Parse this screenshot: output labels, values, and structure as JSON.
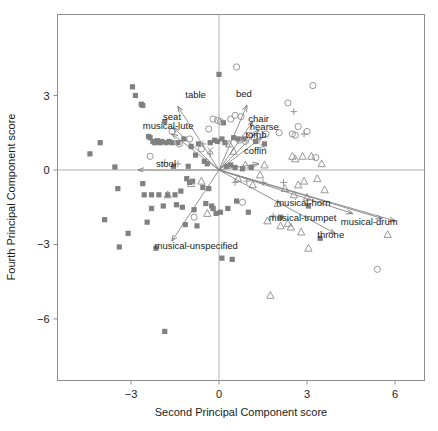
{
  "chart_data": {
    "type": "scatter",
    "title": "",
    "subtitle": "",
    "xlabel": "Second Principal Component score",
    "ylabel": "Fourth Principal Component score",
    "xlim": [
      -4.6,
      7.05
    ],
    "ylim": [
      -7.3,
      4.4
    ],
    "xticks": [
      -3,
      0,
      3,
      6
    ],
    "xtick_labels": [
      "-3",
      "0",
      "3",
      "6"
    ],
    "yticks": [
      3,
      0,
      -3,
      -6
    ],
    "ytick_labels": [
      "3",
      "0",
      "-3",
      "-6"
    ],
    "grid": false,
    "legend_position": "none",
    "reference_lines": {
      "x": 0,
      "y": 0,
      "color": "#b4b4b4"
    },
    "colors": {
      "square": "#808080",
      "circle": "#8c8c8c",
      "triangle": "#8c8c8c",
      "plus": "#8c8c8c",
      "cross": "#8c8c8c",
      "arrow": "#808080",
      "frame": "#8c8c8c",
      "text": "#1a1a1a"
    },
    "marker_groups": [
      {
        "name": "filled-square",
        "symbol": "square",
        "points": [
          [
            -4.4,
            0.65
          ],
          [
            -4.05,
            1.1
          ],
          [
            -3.9,
            -2.0
          ],
          [
            -3.55,
            0.12
          ],
          [
            -3.45,
            -0.75
          ],
          [
            -3.4,
            -3.1
          ],
          [
            -3.1,
            -2.55
          ],
          [
            -2.95,
            3.35
          ],
          [
            -2.85,
            3.0
          ],
          [
            -2.65,
            2.65
          ],
          [
            -2.6,
            2.6
          ],
          [
            -2.6,
            -0.55
          ],
          [
            -2.55,
            -1.0
          ],
          [
            -2.45,
            -2.1
          ],
          [
            -2.4,
            1.35
          ],
          [
            -2.35,
            1.3
          ],
          [
            -2.3,
            -1.0
          ],
          [
            -2.3,
            -1.55
          ],
          [
            -2.25,
            1.15
          ],
          [
            -2.2,
            1.1
          ],
          [
            -2.15,
            -3.15
          ],
          [
            -2.12,
            1.12
          ],
          [
            -2.1,
            1.18
          ],
          [
            -2.05,
            -1.0
          ],
          [
            -2.0,
            1.1
          ],
          [
            -1.95,
            1.15
          ],
          [
            -1.9,
            -1.45
          ],
          [
            -1.85,
            1.95
          ],
          [
            -1.85,
            -6.5
          ],
          [
            -1.8,
            1.1
          ],
          [
            -1.75,
            -1.0
          ],
          [
            -1.7,
            1.15
          ],
          [
            -1.6,
            1.1
          ],
          [
            -1.55,
            0.15
          ],
          [
            -1.5,
            -1.0
          ],
          [
            -1.45,
            -1.4
          ],
          [
            -1.4,
            1.1
          ],
          [
            -1.3,
            -0.85
          ],
          [
            -1.25,
            -1.5
          ],
          [
            -1.2,
            1.25
          ],
          [
            -1.15,
            -2.2
          ],
          [
            -1.1,
            -0.35
          ],
          [
            -1.05,
            0.15
          ],
          [
            -1.0,
            -0.5
          ],
          [
            -0.95,
            0.95
          ],
          [
            -0.9,
            -0.45
          ],
          [
            -0.85,
            -1.6
          ],
          [
            -0.8,
            0.6
          ],
          [
            -0.75,
            -2.25
          ],
          [
            -0.7,
            1.05
          ],
          [
            -0.55,
            -0.7
          ],
          [
            -0.5,
            0.35
          ],
          [
            -0.45,
            -1.35
          ],
          [
            -0.4,
            0.25
          ],
          [
            -0.35,
            -0.75
          ],
          [
            -0.3,
            1.1
          ],
          [
            -0.25,
            -1.45
          ],
          [
            -0.2,
            -1.55
          ],
          [
            -0.15,
            1.2
          ],
          [
            -0.1,
            -1.75
          ],
          [
            -0.05,
            1.15
          ],
          [
            0.0,
            3.85
          ],
          [
            0.05,
            -1.7
          ],
          [
            0.1,
            1.25
          ],
          [
            0.1,
            -3.55
          ],
          [
            0.15,
            1.9
          ],
          [
            0.2,
            1.1
          ],
          [
            0.25,
            0.15
          ],
          [
            0.3,
            -1.55
          ],
          [
            0.4,
            0.2
          ],
          [
            0.45,
            -3.6
          ],
          [
            0.5,
            1.3
          ],
          [
            0.55,
            0.1
          ],
          [
            0.6,
            -1.25
          ],
          [
            0.65,
            1.25
          ],
          [
            0.8,
            0.05
          ],
          [
            0.85,
            1.25
          ],
          [
            1.0,
            -1.7
          ],
          [
            1.1,
            0.1
          ],
          [
            1.25,
            1.15
          ],
          [
            1.55,
            1.05
          ],
          [
            2.1,
            -1.9
          ],
          [
            3.05,
            -1.45
          ],
          [
            3.45,
            -2.75
          ]
        ]
      },
      {
        "name": "open-circle",
        "symbol": "circle",
        "points": [
          [
            -2.35,
            0.55
          ],
          [
            -1.6,
            1.55
          ],
          [
            -1.35,
            1.05
          ],
          [
            -1.0,
            1.25
          ],
          [
            -0.85,
            -1.9
          ],
          [
            -0.6,
            0.85
          ],
          [
            -0.35,
            1.65
          ],
          [
            -0.2,
            2.05
          ],
          [
            -0.05,
            2.0
          ],
          [
            0.05,
            1.95
          ],
          [
            0.4,
            2.05
          ],
          [
            0.55,
            2.2
          ],
          [
            0.6,
            4.15
          ],
          [
            0.7,
            1.2
          ],
          [
            0.75,
            2.15
          ],
          [
            0.8,
            -1.3
          ],
          [
            0.9,
            1.15
          ],
          [
            1.05,
            1.4
          ],
          [
            1.2,
            1.3
          ],
          [
            1.6,
            1.45
          ],
          [
            2.05,
            1.5
          ],
          [
            2.35,
            2.7
          ],
          [
            2.5,
            1.45
          ],
          [
            2.6,
            1.4
          ],
          [
            2.7,
            1.75
          ],
          [
            3.0,
            1.55
          ],
          [
            3.2,
            3.4
          ],
          [
            3.3,
            0.5
          ],
          [
            5.4,
            -4.0
          ]
        ]
      },
      {
        "name": "open-triangle",
        "symbol": "triangle",
        "points": [
          [
            -1.75,
            -1.0
          ],
          [
            -0.95,
            -0.55
          ],
          [
            -0.6,
            -0.45
          ],
          [
            -0.4,
            -1.75
          ],
          [
            0.35,
            1.05
          ],
          [
            0.5,
            0.75
          ],
          [
            0.65,
            -0.35
          ],
          [
            0.9,
            0.2
          ],
          [
            1.15,
            -0.6
          ],
          [
            1.4,
            -0.2
          ],
          [
            1.55,
            0.2
          ],
          [
            1.65,
            -2.05
          ],
          [
            1.75,
            -5.05
          ],
          [
            2.0,
            -1.35
          ],
          [
            2.1,
            -2.25
          ],
          [
            2.25,
            -0.75
          ],
          [
            2.35,
            -2.15
          ],
          [
            2.45,
            -2.3
          ],
          [
            2.5,
            0.55
          ],
          [
            2.55,
            -1.0
          ],
          [
            2.6,
            0.45
          ],
          [
            2.7,
            -0.6
          ],
          [
            2.8,
            -2.5
          ],
          [
            2.85,
            0.55
          ],
          [
            2.9,
            -0.45
          ],
          [
            3.0,
            -1.1
          ],
          [
            3.05,
            -3.15
          ],
          [
            3.15,
            0.55
          ],
          [
            3.35,
            -0.35
          ],
          [
            3.5,
            0.25
          ],
          [
            3.6,
            -0.8
          ],
          [
            5.75,
            -2.6
          ]
        ]
      },
      {
        "name": "plus",
        "symbol": "plus",
        "points": [
          [
            -1.85,
            0.3
          ],
          [
            -1.4,
            0.25
          ],
          [
            -0.55,
            1.05
          ],
          [
            -0.3,
            0.65
          ],
          [
            0.25,
            1.05
          ],
          [
            0.55,
            -0.5
          ],
          [
            0.95,
            -0.45
          ],
          [
            1.5,
            -0.5
          ],
          [
            1.85,
            -1.85
          ],
          [
            2.2,
            -0.5
          ],
          [
            2.55,
            2.35
          ],
          [
            2.9,
            1.45
          ]
        ]
      },
      {
        "name": "cross",
        "symbol": "cross",
        "points": [
          [
            -2.3,
            -1.55
          ],
          [
            -0.3,
            0.8
          ],
          [
            1.5,
            0.95
          ]
        ]
      }
    ],
    "vectors": [
      {
        "label": "table",
        "tip": [
          -1.4,
          2.55
        ],
        "label_pos": [
          -1.15,
          2.9
        ],
        "anchor": "start"
      },
      {
        "label": "seat",
        "tip": [
          -1.55,
          1.7
        ],
        "label_pos": [
          -1.6,
          2.0
        ],
        "anchor": "middle"
      },
      {
        "label": "musical-lute",
        "tip": [
          -1.6,
          1.45
        ],
        "label_pos": [
          -2.6,
          1.65
        ],
        "anchor": "start"
      },
      {
        "label": "stool",
        "tip": [
          -2.75,
          0.0
        ],
        "label_pos": [
          -2.15,
          0.12
        ],
        "anchor": "start"
      },
      {
        "label": "bed",
        "tip": [
          0.95,
          2.6
        ],
        "label_pos": [
          0.85,
          2.92
        ],
        "anchor": "middle"
      },
      {
        "label": "chair",
        "tip": [
          1.15,
          1.95
        ],
        "label_pos": [
          1.0,
          1.95
        ],
        "anchor": "start"
      },
      {
        "label": "hearse",
        "tip": [
          1.35,
          1.6
        ],
        "label_pos": [
          1.05,
          1.62
        ],
        "anchor": "start"
      },
      {
        "label": "tomb",
        "tip": [
          1.45,
          1.3
        ],
        "label_pos": [
          0.9,
          1.3
        ],
        "anchor": "start"
      },
      {
        "label": "coffin",
        "tip": [
          1.35,
          0.25
        ],
        "label_pos": [
          0.85,
          0.65
        ],
        "anchor": "start"
      },
      {
        "label": "musical-horn",
        "tip": [
          5.55,
          -1.95
        ],
        "label_pos": [
          1.95,
          -1.45
        ],
        "anchor": "start"
      },
      {
        "label": "musical-trumpet",
        "tip": [
          4.55,
          -1.75
        ],
        "label_pos": [
          1.7,
          -2.05
        ],
        "anchor": "start"
      },
      {
        "label": "musical-drum",
        "tip": [
          6.0,
          -2.05
        ],
        "label_pos": [
          4.15,
          -2.2
        ],
        "anchor": "start"
      },
      {
        "label": "throne",
        "tip": [
          3.95,
          -2.55
        ],
        "label_pos": [
          3.35,
          -2.75
        ],
        "anchor": "start"
      },
      {
        "label": "musical-unspecified",
        "tip": [
          -1.6,
          -2.85
        ],
        "label_pos": [
          -2.2,
          -3.2
        ],
        "anchor": "start"
      }
    ]
  }
}
